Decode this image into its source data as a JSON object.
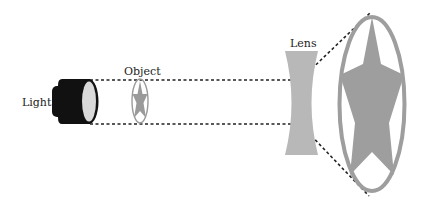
{
  "diagram": {
    "labels": {
      "light": "Light",
      "object": "Object",
      "lens": "Lens"
    },
    "colors": {
      "flashlight_body": "#111111",
      "flashlight_face": "#d9d9d9",
      "object_gray": "#9a9a9a",
      "lens_gray": "#b8b8b8",
      "image_gray": "#9e9e9e",
      "ray_dash": "#222222"
    },
    "components": [
      {
        "id": "light",
        "type": "flashlight"
      },
      {
        "id": "object",
        "type": "star-in-ellipse",
        "scale": "small"
      },
      {
        "id": "lens",
        "type": "concave-lens"
      },
      {
        "id": "image",
        "type": "star-in-ellipse",
        "scale": "magnified"
      }
    ],
    "rays": [
      {
        "from": "light",
        "to": "lens",
        "path": "top",
        "style": "dashed"
      },
      {
        "from": "light",
        "to": "lens",
        "path": "bottom",
        "style": "dashed"
      },
      {
        "from": "lens",
        "to": "image",
        "path": "top-diverging",
        "style": "dashed"
      },
      {
        "from": "lens",
        "to": "image",
        "path": "bottom-diverging",
        "style": "dashed"
      }
    ]
  }
}
